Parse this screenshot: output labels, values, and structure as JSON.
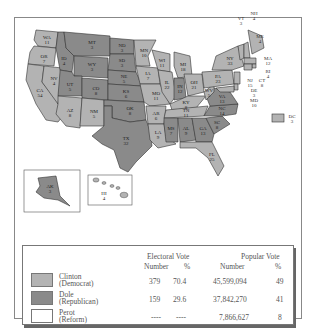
{
  "colors": {
    "democrat": "#b3b3b3",
    "republican": "#8a8a8a",
    "reform": "#ffffff",
    "border": "#333333"
  },
  "map": {
    "states": [
      {
        "abbr": "WA",
        "ev": "11",
        "party": "D"
      },
      {
        "abbr": "OR",
        "ev": "7",
        "party": "D"
      },
      {
        "abbr": "CA",
        "ev": "54",
        "party": "D"
      },
      {
        "abbr": "NV",
        "ev": "4",
        "party": "D"
      },
      {
        "abbr": "ID",
        "ev": "4",
        "party": "R"
      },
      {
        "abbr": "MT",
        "ev": "3",
        "party": "R"
      },
      {
        "abbr": "WY",
        "ev": "3",
        "party": "R"
      },
      {
        "abbr": "UT",
        "ev": "5",
        "party": "R"
      },
      {
        "abbr": "CO",
        "ev": "8",
        "party": "R"
      },
      {
        "abbr": "AZ",
        "ev": "8",
        "party": "D"
      },
      {
        "abbr": "NM",
        "ev": "5",
        "party": "D"
      },
      {
        "abbr": "ND",
        "ev": "3",
        "party": "R"
      },
      {
        "abbr": "SD",
        "ev": "3",
        "party": "R"
      },
      {
        "abbr": "NE",
        "ev": "5",
        "party": "R"
      },
      {
        "abbr": "KS",
        "ev": "6",
        "party": "R"
      },
      {
        "abbr": "OK",
        "ev": "8",
        "party": "R"
      },
      {
        "abbr": "TX",
        "ev": "32",
        "party": "R"
      },
      {
        "abbr": "MN",
        "ev": "10",
        "party": "D"
      },
      {
        "abbr": "IA",
        "ev": "7",
        "party": "D"
      },
      {
        "abbr": "MO",
        "ev": "11",
        "party": "D"
      },
      {
        "abbr": "AR",
        "ev": "6",
        "party": "D"
      },
      {
        "abbr": "LA",
        "ev": "9",
        "party": "D"
      },
      {
        "abbr": "WI",
        "ev": "11",
        "party": "D"
      },
      {
        "abbr": "IL",
        "ev": "22",
        "party": "D"
      },
      {
        "abbr": "MI",
        "ev": "18",
        "party": "D"
      },
      {
        "abbr": "IN",
        "ev": "12",
        "party": "R"
      },
      {
        "abbr": "OH",
        "ev": "21",
        "party": "D"
      },
      {
        "abbr": "KY",
        "ev": "8",
        "party": "D"
      },
      {
        "abbr": "TN",
        "ev": "11",
        "party": "D"
      },
      {
        "abbr": "MS",
        "ev": "7",
        "party": "R"
      },
      {
        "abbr": "AL",
        "ev": "9",
        "party": "R"
      },
      {
        "abbr": "GA",
        "ev": "13",
        "party": "R"
      },
      {
        "abbr": "FL",
        "ev": "25",
        "party": "D"
      },
      {
        "abbr": "SC",
        "ev": "8",
        "party": "R"
      },
      {
        "abbr": "NC",
        "ev": "14",
        "party": "R"
      },
      {
        "abbr": "VA",
        "ev": "13",
        "party": "R"
      },
      {
        "abbr": "WV",
        "ev": "5",
        "party": "D"
      },
      {
        "abbr": "PA",
        "ev": "23",
        "party": "D"
      },
      {
        "abbr": "NY",
        "ev": "33",
        "party": "D"
      },
      {
        "abbr": "VT",
        "ev": "3",
        "party": "D"
      },
      {
        "abbr": "NH",
        "ev": "4",
        "party": "D"
      },
      {
        "abbr": "ME",
        "ev": "4",
        "party": "D"
      },
      {
        "abbr": "MA",
        "ev": "12",
        "party": "D"
      },
      {
        "abbr": "RI",
        "ev": "4",
        "party": "D"
      },
      {
        "abbr": "CT",
        "ev": "8",
        "party": "D"
      },
      {
        "abbr": "NJ",
        "ev": "15",
        "party": "D"
      },
      {
        "abbr": "DE",
        "ev": "3",
        "party": "D"
      },
      {
        "abbr": "MD",
        "ev": "10",
        "party": "D"
      },
      {
        "abbr": "DC",
        "ev": "3",
        "party": "D"
      },
      {
        "abbr": "AK",
        "ev": "3",
        "party": "R"
      },
      {
        "abbr": "HI",
        "ev": "4",
        "party": "D"
      }
    ]
  },
  "table": {
    "headers": {
      "electoral_vote": "Electoral Vote",
      "popular_vote": "Popular Vote",
      "ev_number": "Number",
      "ev_pct": "%",
      "pv_number": "Number",
      "pv_pct": "%"
    },
    "rows": [
      {
        "name": "Clinton",
        "party": "(Democrat)",
        "ev_number": "379",
        "ev_pct": "70.4",
        "pv_number": "45,599,094",
        "pv_pct": "49"
      },
      {
        "name": "Dole",
        "party": "(Republican)",
        "ev_number": "159",
        "ev_pct": "29.6",
        "pv_number": "37,842,270",
        "pv_pct": "41"
      },
      {
        "name": "Perot",
        "party": "(Reform)",
        "ev_number": "----",
        "ev_pct": "----",
        "pv_number": "7,866,627",
        "pv_pct": "8"
      }
    ]
  }
}
